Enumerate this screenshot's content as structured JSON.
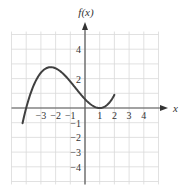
{
  "chart_data": {
    "type": "line",
    "title": "",
    "xlabel": "x",
    "ylabel": "f(x)",
    "xlim": [
      -5,
      5
    ],
    "ylim": [
      -5,
      5
    ],
    "grid": true,
    "x_ticks": [
      -3,
      -2,
      -1,
      1,
      2,
      3,
      4
    ],
    "y_ticks": [
      4,
      2,
      -1,
      -2,
      -3,
      -4
    ],
    "x_tick_labels": [
      "−3",
      "−2",
      "−1",
      "1",
      "2",
      "3",
      "4"
    ],
    "y_tick_labels": [
      "4",
      "2",
      "−1",
      "−2",
      "−3",
      "−4"
    ],
    "series": [
      {
        "name": "f(x)",
        "x": [
          -4.25,
          -4,
          -3.5,
          -3,
          -2.5,
          -2,
          -1.5,
          -1,
          -0.5,
          0,
          0.5,
          1,
          1.5,
          2
        ],
        "y": [
          -1.0,
          0,
          1.0,
          2.4,
          2.6,
          2.7,
          2.4,
          2.0,
          1.3,
          0.6,
          0.17,
          0,
          0.2,
          0.9
        ]
      }
    ],
    "key_points": {
      "x_intercepts": [
        -4,
        1
      ],
      "local_max": [
        -2,
        2.7
      ],
      "local_min": [
        1,
        0
      ],
      "y_intercept": 0.6,
      "endpoint": [
        2,
        0.9
      ]
    }
  },
  "axes": {
    "x_label": "x",
    "y_label": "f(x)"
  }
}
